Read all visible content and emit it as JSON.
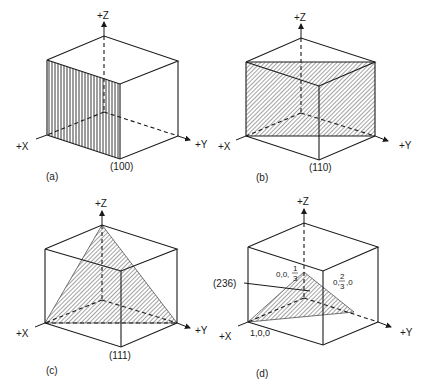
{
  "figure": {
    "panels": [
      {
        "id": "a",
        "caption": "(a)",
        "plane": "(100)",
        "axes": {
          "x": "+X",
          "y": "+Y",
          "z": "+Z"
        }
      },
      {
        "id": "b",
        "caption": "(b)",
        "plane": "(110)",
        "axes": {
          "x": "+X",
          "y": "+Y",
          "z": "+Z"
        }
      },
      {
        "id": "c",
        "caption": "(c)",
        "plane": "(111)",
        "axes": {
          "x": "+X",
          "y": "+Y",
          "z": "+Z"
        }
      },
      {
        "id": "d",
        "caption": "(d)",
        "plane": "(236)",
        "axes": {
          "x": "+X",
          "y": "+Y",
          "z": "+Z"
        },
        "intercepts": {
          "x": "1,0,0",
          "y_prefix": "0,",
          "y_num": "2",
          "y_den": "3",
          "y_suffix": ",0",
          "z_prefix": "0,0,",
          "z_num": "1",
          "z_den": "3"
        }
      }
    ]
  },
  "colors": {
    "line": "#1a1a1a",
    "background": "#ffffff"
  }
}
